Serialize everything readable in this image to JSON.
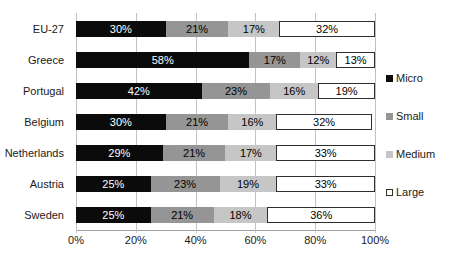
{
  "chart_data": {
    "type": "bar",
    "orientation": "horizontal-stacked",
    "title": "",
    "xlabel": "",
    "ylabel": "",
    "xlim": [
      0,
      100
    ],
    "grid": "vertical",
    "categories": [
      "EU-27",
      "Greece",
      "Portugal",
      "Belgium",
      "Netherlands",
      "Austria",
      "Sweden"
    ],
    "series": [
      {
        "name": "Micro",
        "color": "#0b0b0b",
        "label_color": "#ffffff",
        "values": [
          30,
          58,
          42,
          30,
          29,
          25,
          25
        ]
      },
      {
        "name": "Small",
        "color": "#959595",
        "label_color": "#000000",
        "values": [
          21,
          17,
          23,
          21,
          21,
          23,
          21
        ]
      },
      {
        "name": "Medium",
        "color": "#c6c6c6",
        "label_color": "#000000",
        "values": [
          17,
          12,
          16,
          16,
          17,
          19,
          18
        ]
      },
      {
        "name": "Large",
        "color": "#ffffff",
        "label_color": "#000000",
        "border_color": "#2e2e2e",
        "values": [
          32,
          13,
          19,
          32,
          33,
          33,
          36
        ]
      }
    ],
    "value_suffix": "%",
    "x_ticks": [
      "0%",
      "20%",
      "40%",
      "60%",
      "80%",
      "100%"
    ],
    "x_tick_values": [
      0,
      20,
      40,
      60,
      80,
      100
    ],
    "legend": {
      "position": "right",
      "entries": [
        "Micro",
        "Small",
        "Medium",
        "Large"
      ]
    }
  },
  "colors": {
    "background": "#ffffff",
    "gridline": "#c2c2c2",
    "axis_line": "#9e9e9e",
    "text": "#1a1a1a"
  }
}
